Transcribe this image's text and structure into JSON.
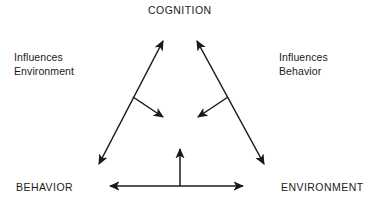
{
  "diagram": {
    "type": "triadic-reciprocal-determinism",
    "background_color": "#ffffff",
    "line_color": "#1a1a1a",
    "nodes": {
      "top": "COGNITION",
      "bottom_left": "BEHAVIOR",
      "bottom_right": "ENVIRONMENT"
    },
    "annotations": {
      "left": {
        "line1": "Influences",
        "line2": "Environment"
      },
      "right": {
        "line1": "Influences",
        "line2": "Behavior"
      }
    },
    "connectors": [
      {
        "name": "behavior-cognition-arrow",
        "from": "BEHAVIOR",
        "to": "COGNITION",
        "arrowheads": "both",
        "x1": 97,
        "y1": 168,
        "x2": 165,
        "y2": 37
      },
      {
        "name": "cognition-environment-arrow",
        "from": "COGNITION",
        "to": "ENVIRONMENT",
        "arrowheads": "both",
        "x1": 195,
        "y1": 37,
        "x2": 266,
        "y2": 168
      },
      {
        "name": "behavior-environment-arrow",
        "from": "BEHAVIOR",
        "to": "ENVIRONMENT",
        "arrowheads": "both",
        "x1": 105,
        "y1": 186,
        "x2": 248,
        "y2": 186
      },
      {
        "name": "center-up-arrow",
        "from": "baseline",
        "to": "center",
        "arrowheads": "end",
        "x1": 180,
        "y1": 186,
        "x2": 180,
        "y2": 144
      },
      {
        "name": "left-inward-branch-arrow",
        "from": "left-diagonal",
        "to": "center",
        "arrowheads": "end",
        "x1": 133,
        "y1": 97,
        "x2": 167,
        "y2": 120
      },
      {
        "name": "right-inward-branch-arrow",
        "from": "right-diagonal",
        "to": "center",
        "arrowheads": "end",
        "x1": 228,
        "y1": 97,
        "x2": 194,
        "y2": 120
      }
    ]
  }
}
